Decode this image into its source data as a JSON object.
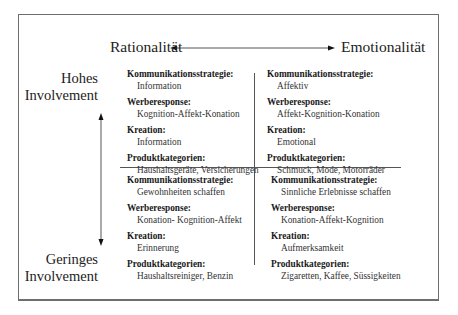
{
  "axes": {
    "horizontal": {
      "left_label": "Rationalität",
      "right_label": "Emotionalität"
    },
    "vertical": {
      "top_label_line1": "Hohes",
      "top_label_line2": "Involvement",
      "bottom_label_line1": "Geringes",
      "bottom_label_line2": "Involvement"
    }
  },
  "quadrants": {
    "top_left": {
      "items": [
        {
          "title": "Kommunikationsstrategie:",
          "value": "Information"
        },
        {
          "title": "Werberesponse:",
          "value": "Kognition-Affekt-Konation"
        },
        {
          "title": "Kreation:",
          "value": "Information"
        },
        {
          "title": "Produktkategorien:",
          "value": "Haushaltsgeräte, Versicherungen"
        }
      ]
    },
    "top_right": {
      "items": [
        {
          "title": "Kommunikationsstrategie:",
          "value": "Affektiv"
        },
        {
          "title": "Werberesponse:",
          "value": "Affekt-Kognition-Konation"
        },
        {
          "title": "Kreation:",
          "value": "Emotional"
        },
        {
          "title": "Produktkategorien:",
          "value": "Schmuck, Mode, Motorräder"
        }
      ]
    },
    "bottom_left": {
      "items": [
        {
          "title": "Kommunikationsstrategie:",
          "value": "Gewohnheiten schaffen"
        },
        {
          "title": "Werberesponse:",
          "value": "Konation- Kognition-Affekt"
        },
        {
          "title": "Kreation:",
          "value": "Erinnerung"
        },
        {
          "title": "Produktkategorien:",
          "value": "Haushaltsreiniger, Benzin"
        }
      ]
    },
    "bottom_right": {
      "items": [
        {
          "title": "Kommunikationsstrategie:",
          "value": "Sinnliche Erlebnisse schaffen"
        },
        {
          "title": "Werberesponse:",
          "value": "Konation-Affekt-Kognition"
        },
        {
          "title": "Kreation:",
          "value": "Aufmerksamkeit"
        },
        {
          "title": "Produktkategorien:",
          "value": "Zigaretten, Kaffee, Süssigkeiten"
        }
      ]
    }
  },
  "colors": {
    "line": "#555555",
    "text": "#1a1a1a",
    "border": "#6e6e6e"
  }
}
